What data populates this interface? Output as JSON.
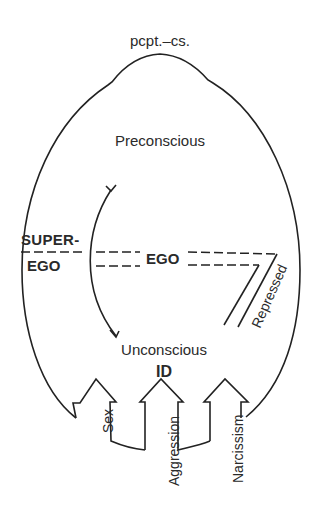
{
  "diagram": {
    "title": "pcpt.–cs.",
    "regions": {
      "preconscious": "Preconscious",
      "unconscious": "Unconscious",
      "id": "ID"
    },
    "structures": {
      "superego_line1": "SUPER-",
      "superego_line2": "EGO",
      "ego": "EGO",
      "repressed": "Repressed"
    },
    "drives": [
      {
        "label": "Sex"
      },
      {
        "label": "Aggression"
      },
      {
        "label": "Narcissism"
      }
    ],
    "colors": {
      "line": "#222222",
      "text": "#2a2a2a",
      "background": "#ffffff"
    }
  }
}
